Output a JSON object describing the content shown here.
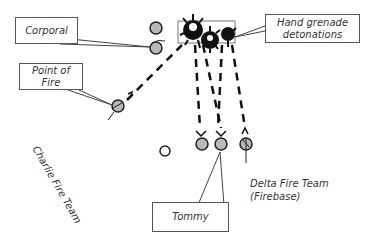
{
  "diagram": {
    "callouts": {
      "corporal": "Corporal",
      "point_of_fire_line1": "Point of",
      "point_of_fire_line2": "Fire",
      "grenade_line1": "Hand grenade",
      "grenade_line2": "detonations",
      "tommy": "Tommy"
    },
    "labels": {
      "charlie_team": "Charlie Fire Team",
      "delta_line1": "Delta Fire Team",
      "delta_line2": "(Firebase)"
    },
    "colors": {
      "soldier_fill": "#b8b8b8",
      "stroke": "#222222",
      "explosion": "#111111"
    }
  }
}
